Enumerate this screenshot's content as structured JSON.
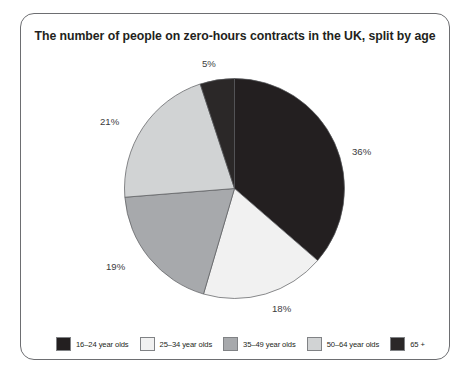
{
  "frame": {
    "border_color": "#6d6e71"
  },
  "chart_data": {
    "type": "pie",
    "title": "The number of people on zero-hours contracts in the UK, split by age",
    "xlabel": "",
    "ylabel": "",
    "legend_position": "bottom",
    "grid": false,
    "start_angle_deg": 0,
    "direction": "clockwise",
    "categories": [
      "16–24 year olds",
      "25–34 year olds",
      "35–49 year olds",
      "50–64 year olds",
      "65 +"
    ],
    "values": [
      36,
      18,
      19,
      21,
      5
    ],
    "value_labels": [
      "36%",
      "18%",
      "19%",
      "21%",
      "5%"
    ],
    "colors": [
      "#231f20",
      "#f1f1f1",
      "#a7a9ac",
      "#d1d3d4",
      "#2b2828"
    ],
    "slices": [
      {
        "label": "16–24 year olds",
        "value": 36,
        "value_label": "36%",
        "color": "#231f20"
      },
      {
        "label": "25–34 year olds",
        "value": 18,
        "value_label": "18%",
        "color": "#f1f1f1"
      },
      {
        "label": "35–49 year olds",
        "value": 19,
        "value_label": "19%",
        "color": "#a7a9ac"
      },
      {
        "label": "50–64 year olds",
        "value": 21,
        "value_label": "21%",
        "color": "#d1d3d4"
      },
      {
        "label": "65 +",
        "value": 5,
        "value_label": "5%",
        "color": "#2b2828"
      }
    ],
    "units": "percent",
    "total": 99
  },
  "legend": {
    "items": [
      {
        "label": "16–24 year olds",
        "color": "#231f20"
      },
      {
        "label": "25–34 year olds",
        "color": "#f1f1f1"
      },
      {
        "label": "35–49 year olds",
        "color": "#a7a9ac"
      },
      {
        "label": "50–64 year olds",
        "color": "#d1d3d4"
      },
      {
        "label": "65 +",
        "color": "#2b2828"
      }
    ]
  }
}
